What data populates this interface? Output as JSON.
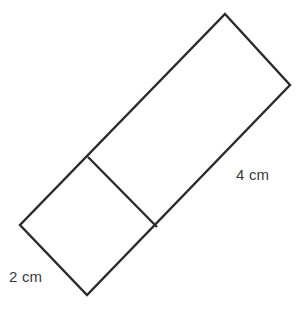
{
  "figure": {
    "background_color": "#ffffff",
    "stroke_color": "#2b2b2b",
    "stroke_width": 2.4,
    "label_color": "#3a3a3a",
    "canvas": {
      "width": 303,
      "height": 310
    },
    "vertices": {
      "top": {
        "x": 225,
        "y": 14
      },
      "right": {
        "x": 290,
        "y": 85
      },
      "divider_lower": {
        "x": 157,
        "y": 227
      },
      "bottom": {
        "x": 87,
        "y": 295
      },
      "left": {
        "x": 20,
        "y": 225
      },
      "divider_upper": {
        "x": 88,
        "y": 157
      }
    },
    "outline_points": "225,14 290,85 87,295 20,225",
    "divider_points": "88,157 157,227",
    "shapes": [
      {
        "name": "square",
        "points": "88,157 157,227 87,295 20,225",
        "side_label": "2 cm"
      },
      {
        "name": "rectangle",
        "points": "225,14 290,85 157,227 88,157",
        "side_label": "4 cm"
      }
    ],
    "labels": [
      {
        "id": "label-2cm",
        "name": "dimension-label-2cm",
        "text": "2 cm",
        "x": 9,
        "y": 269,
        "describes": "square-side-length"
      },
      {
        "id": "label-4cm",
        "name": "dimension-label-4cm",
        "text": "4 cm",
        "x": 236,
        "y": 167,
        "describes": "rectangle-long-side-length"
      }
    ]
  }
}
